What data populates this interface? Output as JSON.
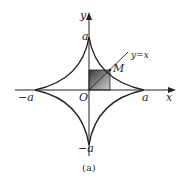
{
  "figure": {
    "caption": "(a)",
    "curve": "astroid",
    "labels": {
      "y_axis": "y",
      "x_axis": "x",
      "top": "a",
      "right": "a",
      "left": "−a",
      "bottom": "−a",
      "origin": "O",
      "point": "M",
      "line": "y=x"
    },
    "colors": {
      "stroke": "#222222",
      "shade_dark": "#3a3a3a",
      "shade_light": "#c8c8c8"
    }
  }
}
